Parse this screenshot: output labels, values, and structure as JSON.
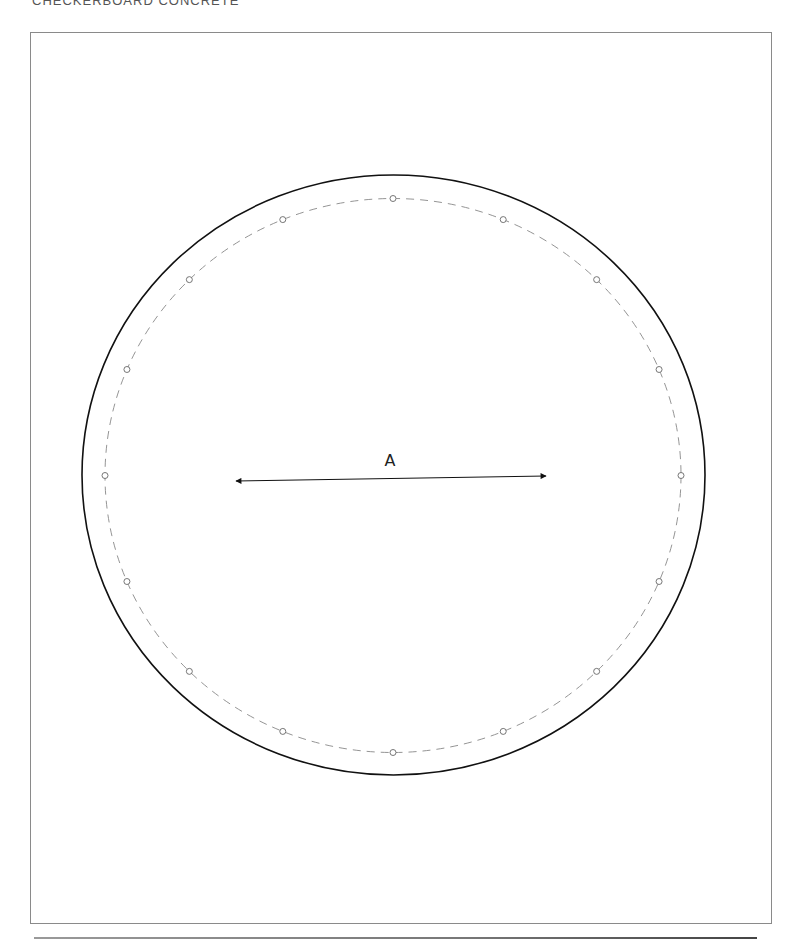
{
  "header": {
    "title": "CHECKERBOARD CONCRETE"
  },
  "drawing": {
    "dimension_label": "A",
    "bolt_hole_count": 16,
    "outer_circle_stroke": "#111111",
    "bolt_circle_stroke": "#777777"
  }
}
